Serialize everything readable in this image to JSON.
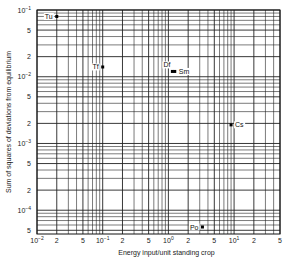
{
  "chart_data": {
    "type": "scatter",
    "title": "",
    "xlabel": "Energy input/unit standing crop",
    "ylabel": "Sum of squares of deviations from equilibrium",
    "xscale": "log",
    "yscale": "log",
    "xlim": [
      0.01,
      50
    ],
    "ylim": [
      4.4e-05,
      0.1
    ],
    "grid": true,
    "x_ticks": [
      {
        "value": 0.01,
        "label": "10",
        "exp": "−2"
      },
      {
        "value": 0.02,
        "label": "2",
        "exp": ""
      },
      {
        "value": 0.05,
        "label": "5",
        "exp": ""
      },
      {
        "value": 0.1,
        "label": "10",
        "exp": "−1"
      },
      {
        "value": 0.2,
        "label": "2",
        "exp": ""
      },
      {
        "value": 0.5,
        "label": "5",
        "exp": ""
      },
      {
        "value": 1,
        "label": "10",
        "exp": "0"
      },
      {
        "value": 2,
        "label": "2",
        "exp": ""
      },
      {
        "value": 5,
        "label": "5",
        "exp": ""
      },
      {
        "value": 10,
        "label": "10",
        "exp": "1"
      },
      {
        "value": 20,
        "label": "2",
        "exp": ""
      },
      {
        "value": 50,
        "label": "5",
        "exp": ""
      }
    ],
    "y_ticks": [
      {
        "value": 0.1,
        "label": "10",
        "exp": "−1"
      },
      {
        "value": 0.05,
        "label": "5",
        "exp": ""
      },
      {
        "value": 0.02,
        "label": "2",
        "exp": ""
      },
      {
        "value": 0.01,
        "label": "10",
        "exp": "−2"
      },
      {
        "value": 0.005,
        "label": "5",
        "exp": ""
      },
      {
        "value": 0.002,
        "label": "2",
        "exp": ""
      },
      {
        "value": 0.001,
        "label": "10",
        "exp": "−3"
      },
      {
        "value": 0.0005,
        "label": "5",
        "exp": ""
      },
      {
        "value": 0.0002,
        "label": "2",
        "exp": ""
      },
      {
        "value": 0.0001,
        "label": "10",
        "exp": "−4"
      },
      {
        "value": 5e-05,
        "label": "5",
        "exp": ""
      }
    ],
    "points": [
      {
        "label": "Tu",
        "x": 0.02,
        "y": 0.08,
        "label_side": "left"
      },
      {
        "label": "Tf",
        "x": 0.1,
        "y": 0.014,
        "label_side": "left"
      },
      {
        "label": "Df",
        "x": 1.15,
        "y": 0.012,
        "label_side": "above-left"
      },
      {
        "label": "Sm",
        "x": 1.25,
        "y": 0.012,
        "label_side": "right"
      },
      {
        "label": "Cs",
        "x": 9,
        "y": 0.0019,
        "label_side": "right"
      },
      {
        "label": "Po",
        "x": 3.3,
        "y": 5.6e-05,
        "label_side": "left"
      }
    ]
  }
}
